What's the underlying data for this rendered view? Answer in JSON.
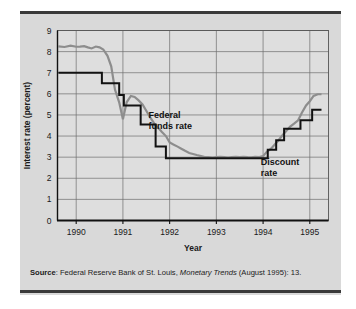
{
  "figure": {
    "background_color": "#d9d9d9",
    "rule_color": "#3a3a3a"
  },
  "source": {
    "label": "Source",
    "separator": ": ",
    "text_before_italic": "Federal Reserve Bank of St. Louis, ",
    "italic_text": "Monetary Trends",
    "text_after_italic": " (August 1995): 13."
  },
  "chart_data": {
    "type": "line",
    "title": "",
    "subtitle": "",
    "xlabel": "Year",
    "ylabel": "Interest rate (percent)",
    "xlim": [
      1989.6,
      1995.4
    ],
    "ylim": [
      0,
      9
    ],
    "grid": true,
    "grid_color": "#6e6e6e",
    "legend_position": "inline-annotation",
    "x_tick_labels": [
      "1990",
      "1991",
      "1992",
      "1993",
      "1994",
      "1995"
    ],
    "x_tick_values": [
      1990,
      1991,
      1992,
      1993,
      1994,
      1995
    ],
    "y_tick_labels": [
      "0",
      "1",
      "2",
      "3",
      "4",
      "5",
      "6",
      "7",
      "8",
      "9"
    ],
    "y_tick_values": [
      0,
      1,
      2,
      3,
      4,
      5,
      6,
      7,
      8,
      9
    ],
    "annotations": [
      {
        "name": "federal-funds-rate-label",
        "line1": "Federal",
        "line2": "funds rate",
        "x": 1991.55,
        "y": 4.85
      },
      {
        "name": "discount-rate-label",
        "line1": "Discount",
        "line2": "rate",
        "x": 1993.95,
        "y": 2.65
      }
    ],
    "series": [
      {
        "name": "Federal funds rate",
        "color": "#8d8d8d",
        "width": 2.2,
        "x": [
          1989.62,
          1989.75,
          1989.88,
          1990.0,
          1990.08,
          1990.17,
          1990.25,
          1990.33,
          1990.42,
          1990.5,
          1990.58,
          1990.67,
          1990.75,
          1990.83,
          1990.92,
          1991.0,
          1991.08,
          1991.17,
          1991.25,
          1991.33,
          1991.42,
          1991.5,
          1991.58,
          1991.67,
          1991.75,
          1991.83,
          1991.92,
          1992.0,
          1992.08,
          1992.17,
          1992.25,
          1992.33,
          1992.42,
          1992.5,
          1992.58,
          1992.67,
          1992.75,
          1992.83,
          1992.92,
          1993.0,
          1993.08,
          1993.17,
          1993.25,
          1993.33,
          1993.42,
          1993.5,
          1993.58,
          1993.67,
          1993.75,
          1993.83,
          1993.92,
          1994.0,
          1994.08,
          1994.17,
          1994.25,
          1994.33,
          1994.42,
          1994.5,
          1994.58,
          1994.67,
          1994.75,
          1994.83,
          1994.92,
          1995.0,
          1995.08,
          1995.17,
          1995.25
        ],
        "y": [
          8.25,
          8.22,
          8.28,
          8.23,
          8.24,
          8.26,
          8.2,
          8.15,
          8.24,
          8.2,
          8.1,
          7.8,
          7.3,
          6.2,
          5.6,
          4.8,
          5.6,
          5.9,
          5.85,
          5.7,
          5.5,
          5.2,
          4.9,
          4.6,
          4.4,
          4.2,
          4.0,
          3.7,
          3.6,
          3.5,
          3.4,
          3.3,
          3.2,
          3.15,
          3.1,
          3.05,
          3.0,
          3.0,
          2.98,
          3.0,
          3.02,
          3.0,
          2.98,
          3.0,
          3.02,
          3.0,
          3.02,
          3.0,
          2.99,
          3.02,
          3.0,
          3.05,
          3.25,
          3.4,
          3.6,
          3.8,
          4.05,
          4.25,
          4.45,
          4.6,
          4.75,
          5.1,
          5.45,
          5.65,
          5.9,
          5.98,
          5.98
        ]
      },
      {
        "name": "Discount rate",
        "color": "#121212",
        "width": 2.0,
        "step": "post",
        "x": [
          1989.62,
          1990.55,
          1990.55,
          1990.92,
          1990.92,
          1991.02,
          1991.02,
          1991.3,
          1991.3,
          1991.38,
          1991.38,
          1991.7,
          1991.7,
          1991.92,
          1991.92,
          1993.78,
          1993.78,
          1994.1,
          1994.1,
          1994.28,
          1994.28,
          1994.45,
          1994.45,
          1994.8,
          1994.8,
          1995.05,
          1995.05,
          1995.25
        ],
        "y": [
          7.0,
          7.0,
          6.5,
          6.5,
          5.95,
          5.95,
          5.45,
          5.45,
          5.45,
          5.45,
          4.55,
          4.55,
          3.5,
          3.5,
          2.95,
          2.95,
          2.95,
          2.95,
          3.35,
          3.35,
          3.8,
          3.8,
          4.35,
          4.35,
          4.75,
          4.75,
          5.25,
          5.25
        ]
      }
    ]
  }
}
